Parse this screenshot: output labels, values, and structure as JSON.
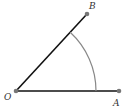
{
  "diagram": {
    "type": "angle",
    "points": {
      "O": {
        "label": "O",
        "x": 16,
        "y": 91
      },
      "A": {
        "label": "A",
        "x": 119,
        "y": 91
      },
      "B": {
        "label": "B",
        "x": 87,
        "y": 14
      }
    },
    "segments": [
      {
        "from": "O",
        "to": "A"
      },
      {
        "from": "O",
        "to": "B"
      }
    ],
    "arc": {
      "center": "O",
      "radius": 80,
      "from": "OB",
      "to": "OA"
    },
    "colors": {
      "line": "#111111",
      "arc": "#888888",
      "point": "#777777",
      "label": "#333333"
    }
  }
}
